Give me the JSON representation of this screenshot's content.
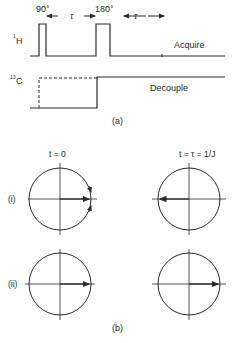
{
  "part_a": {
    "caption": "(a)",
    "h_channel": {
      "label": "1",
      "label_element": "H",
      "pulse1_label": "90°",
      "pulse2_label": "180°",
      "delay1_label": "τ",
      "delay2_label": "τ",
      "action": "Acquire"
    },
    "c_channel": {
      "label": "13",
      "label_element": "C",
      "action": "Decouple"
    }
  },
  "part_b": {
    "caption": "(b)",
    "col_headers": [
      "t = 0",
      "t = τ = 1/J"
    ],
    "row_labels": [
      "(i)",
      "(ii)"
    ],
    "vectors": [
      {
        "row": "(i)",
        "col": "t = 0",
        "direction": "right",
        "rotation_arrows": true
      },
      {
        "row": "(i)",
        "col": "t = τ = 1/J",
        "direction": "left"
      },
      {
        "row": "(ii)",
        "col": "t = 0",
        "direction": "right"
      },
      {
        "row": "(ii)",
        "col": "t = τ = 1/J",
        "direction": "right"
      }
    ]
  },
  "colors": {
    "ink": "#2a2a2a",
    "background": "#ffffff"
  }
}
